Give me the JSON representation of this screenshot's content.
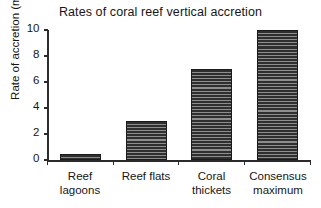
{
  "chart_data": {
    "type": "bar",
    "title": "Rates of coral reef vertical accretion",
    "xlabel": "",
    "ylabel": "Rate of accretion (mm/yr)",
    "categories": [
      "Reef lagoons",
      "Reef flats",
      "Coral thickets",
      "Consensus maximum"
    ],
    "category_lines": [
      [
        "Reef",
        "lagoons"
      ],
      [
        "Reef flats",
        ""
      ],
      [
        "Coral",
        "thickets"
      ],
      [
        "Consensus",
        "maximum"
      ]
    ],
    "values": [
      0.5,
      3.0,
      7.0,
      10.0
    ],
    "ylim": [
      0,
      10
    ],
    "yticks": [
      0,
      2,
      4,
      6,
      8,
      10
    ],
    "ytick_labels": [
      "0",
      "2",
      "4",
      "6",
      "8",
      "10"
    ],
    "grid": false,
    "legend": null,
    "bar_fill": "horizontal-hatch",
    "bar_color": "#3c3c3c",
    "bar_edge_color": "#1b1b1b",
    "axis_color": "#2b2b2b",
    "background": "#ffffff"
  }
}
